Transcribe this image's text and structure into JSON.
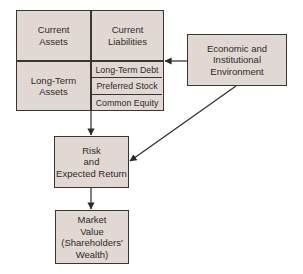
{
  "diagram": {
    "balance_sheet": {
      "current_assets": "Current\nAssets",
      "current_liabilities": "Current\nLiabilities",
      "long_term_assets": "Long-Term\nAssets",
      "liabilities": [
        "Long-Term Debt",
        "Preferred Stock",
        "Common Equity"
      ]
    },
    "environment": "Economic and\nInstitutional\nEnvironment",
    "risk_return": "Risk\nand\nExpected Return",
    "market_value": "Market\nValue\n(Shareholders'\nWealth)",
    "colors": {
      "box_fill": "#e2d8d3",
      "border": "#3a3533",
      "text": "#2e2a28"
    }
  }
}
